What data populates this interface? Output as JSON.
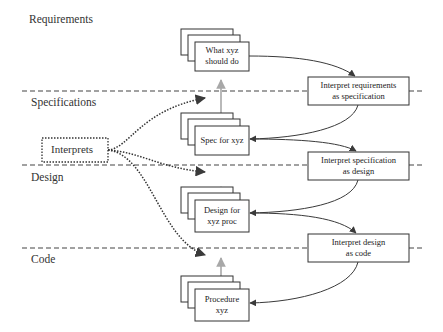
{
  "sections": [
    {
      "id": "requirements",
      "label": "Requirements"
    },
    {
      "id": "specifications",
      "label": "Specifications"
    },
    {
      "id": "design",
      "label": "Design"
    },
    {
      "id": "code",
      "label": "Code"
    }
  ],
  "artifacts": [
    {
      "id": "what",
      "line1": "What xyz",
      "line2": "should do"
    },
    {
      "id": "spec",
      "line1": "Spec for xyz",
      "line2": ""
    },
    {
      "id": "design",
      "line1": "Design for",
      "line2": "xyz proc"
    },
    {
      "id": "procedure",
      "line1": "Procedure",
      "line2": "xyz"
    }
  ],
  "processes": [
    {
      "id": "req-to-spec",
      "line1": "Interpret requirements",
      "line2": "as specification"
    },
    {
      "id": "spec-to-design",
      "line1": "Interpret specification",
      "line2": "as design"
    },
    {
      "id": "design-to-code",
      "line1": "Interpret design",
      "line2": "as code"
    }
  ],
  "interprets": {
    "label": "Interprets"
  },
  "colors": {
    "line": "#3a3a3a",
    "arrow_gray": "#a8a8a8",
    "dashed": "#444444"
  }
}
